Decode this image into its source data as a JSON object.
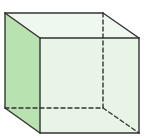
{
  "diagram": {
    "type": "cube",
    "vertices": {
      "back_top_left": [
        5,
        13
      ],
      "back_top_right": [
        103,
        13
      ],
      "back_bottom_left": [
        5,
        108
      ],
      "back_bottom_right": [
        103,
        108
      ],
      "front_top_left": [
        40,
        38
      ],
      "front_top_right": [
        139,
        38
      ],
      "front_bottom_left": [
        40,
        133
      ],
      "front_bottom_right": [
        139,
        133
      ]
    },
    "colors": {
      "left_face": "#b9e2b1",
      "front_face": "#e7f4e6",
      "top_face": "#eef8ee",
      "back_face": "#eaf6ea",
      "edge": "#333333",
      "background": "#ffffff"
    },
    "stroke_width": 1.4,
    "dash_pattern": "4 3"
  }
}
